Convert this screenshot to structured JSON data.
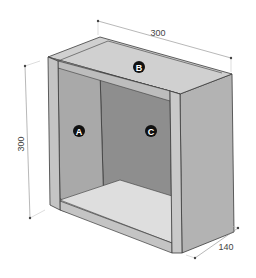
{
  "diagram": {
    "type": "isometric cabinet box with dimensions",
    "dimensions": {
      "width": "300",
      "height": "300",
      "depth": "140"
    },
    "labels": {
      "left_side": "A",
      "top": "B",
      "back": "C"
    },
    "colors": {
      "outline": "#3a3a3a",
      "left_inner": "#a9a9a9",
      "back_panel": "#8e8e8e",
      "top_inner": "#d6d6d6",
      "bottom_inner": "#dcdcdc",
      "edge_face": "#c4c4c4",
      "right_outer": "#b3b3b3",
      "dimension_line": "#888888",
      "marker_fill": "#111111"
    }
  }
}
